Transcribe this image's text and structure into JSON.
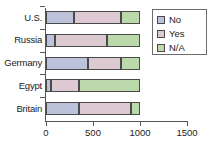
{
  "chart_data": {
    "type": "bar",
    "orientation": "horizontal",
    "stacked": true,
    "title": "",
    "xlabel": "",
    "ylabel": "",
    "categories": [
      "U.S.",
      "Russia",
      "Germany",
      "Egypt",
      "Britain"
    ],
    "series": [
      {
        "name": "No",
        "color": "#bcc2da",
        "values": [
          300,
          100,
          450,
          50,
          350
        ]
      },
      {
        "name": "Yes",
        "color": "#ddc9d2",
        "values": [
          500,
          550,
          350,
          300,
          550
        ]
      },
      {
        "name": "N/A",
        "color": "#bcd9ab",
        "values": [
          200,
          350,
          200,
          650,
          100
        ]
      }
    ],
    "totals": [
      1000,
      1000,
      1000,
      1000,
      1000
    ],
    "xlim": [
      0,
      1500
    ],
    "xticks": [
      0,
      500,
      1000,
      1500
    ],
    "xtick_labels": [
      "0",
      "500",
      "1000",
      "1500"
    ],
    "grid": false,
    "legend": {
      "position": "top-right",
      "entries": [
        {
          "label": "No",
          "color": "#bcc2da"
        },
        {
          "label": "Yes",
          "color": "#ddc9d2"
        },
        {
          "label": "N/A",
          "color": "#bcd9ab"
        }
      ]
    }
  }
}
